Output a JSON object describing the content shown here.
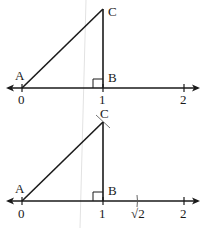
{
  "figures": [
    {
      "id": "top",
      "points": {
        "A": "A",
        "B": "B",
        "C": "C"
      },
      "ticks": [
        {
          "label": "0",
          "value": 0
        },
        {
          "label": "1",
          "value": 1
        },
        {
          "label": "2",
          "value": 2
        }
      ],
      "right_angle_at": "B"
    },
    {
      "id": "bottom",
      "points": {
        "A": "A",
        "B": "B",
        "C": "C"
      },
      "ticks": [
        {
          "label": "0",
          "value": 0
        },
        {
          "label": "1",
          "value": 1
        },
        {
          "label": "√2",
          "value": 1.414
        },
        {
          "label": "2",
          "value": 2
        }
      ],
      "right_angle_at": "B",
      "arc_mark": "compass arc through C and √2"
    }
  ],
  "colors": {
    "ink": "#1a1a1a",
    "background": "#ffffff",
    "crease": "#d8d8d8"
  }
}
